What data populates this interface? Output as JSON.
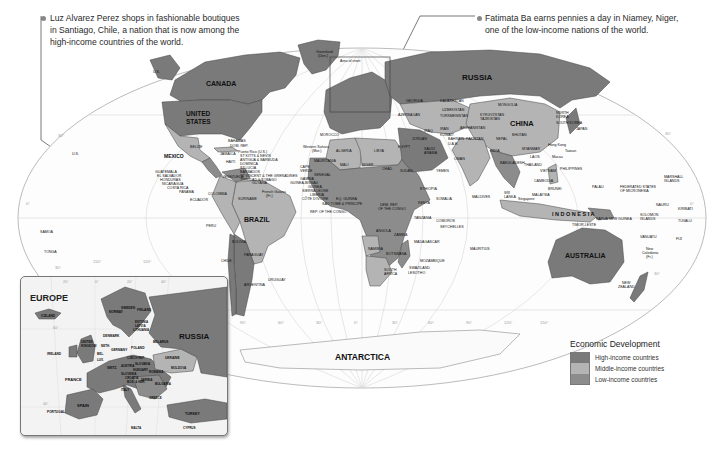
{
  "captions": {
    "left": {
      "text": "Luz Alvarez Perez shops in fashionable boutiques in Santiago, Chile, a nation that is now among the high-income countries of the world.",
      "line1": "Luz Alvarez Perez shops in fashionable boutiques",
      "line2": "in Santiago, Chile, a nation that is now among the",
      "line3": "high-income countries of the world."
    },
    "right": {
      "text": "Fatimata Ba earns pennies a day in Niamey, Niger, one of the low-income nations of the world.",
      "line1": "Fatimata Ba earns pennies a day in Niamey, Niger,",
      "line2": "one of the low-income nations of the world."
    }
  },
  "legend": {
    "title": "Economic Development",
    "items": [
      {
        "label": "High-income countries",
        "color": "#7a7a7a"
      },
      {
        "label": "Middle-income countries",
        "color": "#b4b4b4"
      },
      {
        "label": "Low-income countries",
        "color": "#8c8c8c"
      }
    ]
  },
  "colors": {
    "high": "#7a7a7a",
    "middle": "#b4b4b4",
    "low": "#8c8c8c",
    "ocean": "#ffffff",
    "ocean_tint": "#f2f2f2",
    "border": "#444444",
    "graticule": "#cfcfcf"
  },
  "map": {
    "labels_major": {
      "canada": "CANADA",
      "united_states_1": "UNITED",
      "united_states_2": "STATES",
      "mexico": "MEXICO",
      "brazil": "BRAZIL",
      "russia": "RUSSIA",
      "china": "CHINA",
      "australia": "AUSTRALIA",
      "antarctica": "ANTARCTICA",
      "indonesia": "I N D O N E S I A"
    },
    "labels_minor": {
      "greenland_1": "Greenland",
      "greenland_2": "(Den.)",
      "area_of_inset": "Area of inset",
      "us_alaska": "U.S.",
      "us_hawaii": "U.S.",
      "bahamas": "BAHAMAS",
      "dom_rep": "DOM. REP.",
      "puerto_rico": "Puerto Rico (U.S.)",
      "st_kitts": "ST KITTS & NEVIS",
      "antigua": "ANTIGUA & BARBUDA",
      "dominica": "DOMINICA",
      "st_lucia": "ST LUCIA",
      "barbados": "BARBADOS",
      "st_vincent": "ST VINCENT & THE GRENADINES",
      "trinidad": "TRINIDAD & TOBAGO",
      "belize": "BELIZE",
      "cuba": "CUBA",
      "jamaica": "JAMAICA",
      "haiti": "HAITI",
      "guatemala": "GUATEMALA",
      "el_salvador": "EL SALVADOR",
      "honduras": "HONDURAS",
      "nicaragua": "NICARAGUA",
      "costa_rica": "COSTA RICA",
      "panama": "PANAMA",
      "venezuela": "VENEZUELA",
      "guyana": "GUYANA",
      "suriname": "SURINAME",
      "french_guiana_1": "French Guiana",
      "french_guiana_2": "(Fr.)",
      "colombia": "COLOMBIA",
      "ecuador": "ECUADOR",
      "peru": "PERU",
      "bolivia": "BOLIVIA",
      "paraguay": "PARAGUAY",
      "chile": "CHILE",
      "argentina": "ARGENTINA",
      "uruguay": "URUGUAY",
      "samoa": "SAMOA",
      "tonga": "TONGA",
      "morocco": "MOROCCO",
      "western_sahara_1": "Western Sahara",
      "western_sahara_2": "(Mor.)",
      "algeria": "ALGERIA",
      "libya": "LIBYA",
      "egypt": "EGYPT",
      "mauritania": "MAURITANIA",
      "mali": "MALI",
      "niger": "NIGER",
      "chad": "CHAD",
      "sudan": "SUDAN",
      "cape_verde_1": "CAPE",
      "cape_verde_2": "VERDE",
      "senegal": "SENEGAL",
      "gambia": "GAMBIA",
      "guinea_bissau": "GUINEA-BISSAU",
      "guinea": "GUINEA",
      "sierra_leone": "SIERRA LEONE",
      "liberia": "LIBERIA",
      "cote_divoire": "CÔTE D'IVOIRE",
      "eq_guinea": "EQ. GUINEA",
      "sao_tome": "SAO TOME & PRINCIPE",
      "rep_congo": "REP. OF THE CONGO",
      "dem_rep_congo_1": "DEM. REP.",
      "dem_rep_congo_2": "OF THE CONGO",
      "ethiopia": "ETHIOPIA",
      "somalia": "SOMALIA",
      "kenya": "KENYA",
      "tanzania": "TANZANIA",
      "angola": "ANGOLA",
      "zambia": "ZAMBIA",
      "namibia": "NAMIBIA",
      "botswana": "BOTSWANA",
      "south_africa_1": "SOUTH",
      "south_africa_2": "AFRICA",
      "swaziland": "SWAZILAND",
      "lesotho": "LESOTHO",
      "mozambique": "MOZAMBIQUE",
      "madagascar": "MADAGASCAR",
      "comoros": "COMOROS",
      "seychelles": "SEYCHELLES",
      "mauritius": "MAURITIUS",
      "yemen": "YEMEN",
      "oman": "OMAN",
      "saudi_arabia_1": "SAUDI",
      "saudi_arabia_2": "ARABIA",
      "iraq": "IRAQ",
      "iran": "IRAN",
      "kuwait": "KUWAIT",
      "jordan": "JORDAN",
      "bahrain": "BAHRAIN",
      "qatar": "QATAR",
      "uae": "U.A.E.",
      "georgia": "GEORGIA",
      "azerbaijan": "AZERBAIJAN",
      "kazakhstan": "KAZAKHSTAN",
      "uzbekistan": "UZBEKISTAN",
      "turkmenistan": "TURKMENISTAN",
      "kyrgyzstan": "KYRGYZSTAN",
      "tajikistan": "TAJIKISTAN",
      "afghanistan": "AFGHANISTAN",
      "pakistan": "PAKISTAN",
      "mongolia": "MONGOLIA",
      "india": "INDIA",
      "nepal": "NEPAL",
      "bhutan": "BHUTAN",
      "bangladesh": "BANGLADESH",
      "sri_lanka_1": "SRI",
      "sri_lanka_2": "LANKA",
      "maldives": "MALDIVES",
      "myanmar": "MYANMAR",
      "thailand": "THAILAND",
      "laos": "LAOS",
      "vietnam": "VIETNAM",
      "cambodia": "CAMBODIA",
      "malaysia": "MALAYSIA",
      "singapore": "Singapore",
      "brunei": "BRUNEI",
      "philippines": "PHILIPPINES",
      "taiwan": "Taiwan",
      "macau": "Macau",
      "hong_kong": "Hong Kong",
      "north_korea_1": "NORTH",
      "north_korea_2": "KOREA",
      "south_korea": "SOUTH KOREA",
      "japan": "JAPAN",
      "palau": "PALAU",
      "fsm_1": "FEDERATED STATES",
      "fsm_2": "OF MICRONESIA",
      "marshall_1": "MARSHALL",
      "marshall_2": "ISLANDS",
      "nauru": "NAURU",
      "kiribati": "KIRIBATI",
      "tuvalu": "TUVALU",
      "png": "PAPUA NEW GUINEA",
      "solomon_1": "SOLOMON",
      "solomon_2": "ISLANDS",
      "timor_leste": "TIMOR-LESTE",
      "vanuatu": "VANUATU",
      "fiji": "FIJI",
      "new_caledonia_1": "New",
      "new_caledonia_2": "Caledonia",
      "new_caledonia_3": "(Fr.)",
      "new_zealand_1": "NEW",
      "new_zealand_2": "ZEALAND"
    },
    "graticule_labels": {
      "lat_30n_left": "30°",
      "lat_0_left": "0°",
      "lat_30s_left": "30°",
      "lat_30n_right": "30°",
      "lat_0_right": "0°",
      "lat_30s_right": "30°",
      "lon_150w": "150°",
      "lon_120w": "120°",
      "lon_90w": "90°",
      "lon_60w": "60°",
      "lon_30w": "30°",
      "lon_0": "0°",
      "lon_30e": "30°",
      "lon_60e": "60°",
      "lon_90e": "90°",
      "lon_120e": "120°",
      "lon_150e": "150°"
    }
  },
  "inset": {
    "title": "EUROPE",
    "labels": {
      "iceland": "ICELAND",
      "norway": "NORWAY",
      "sweden": "SWEDEN",
      "finland": "FINLAND",
      "estonia": "ESTONIA",
      "latvia": "LATVIA",
      "lithuania": "LITHUANIA",
      "denmark": "DENMARK",
      "ireland": "IRELAND",
      "uk_1": "UNITED",
      "uk_2": "KINGDOM",
      "neth": "NETH.",
      "bel": "BEL.",
      "lux": "LUX.",
      "germany": "GERMANY",
      "poland": "POLAND",
      "belarus": "BELARUS",
      "russia": "RUSSIA",
      "ukraine": "UKRAINE",
      "moldova": "MOLDOVA",
      "czech": "CZECH REP.",
      "slovakia": "SLOVAKIA",
      "austria": "AUSTRIA",
      "hungary": "HUNGARY",
      "romania": "ROMANIA",
      "switzerland": "SWITZ.",
      "france": "FRANCE",
      "italy": "ITALY",
      "slovenia": "SLOVENIA",
      "croatia": "CROATIA",
      "bosnia": "BOS. & HER.",
      "serbia": "SERBIA",
      "bulgaria": "BULGARIA",
      "greece": "GREECE",
      "spain": "SPAIN",
      "portugal": "PORTUGAL",
      "turkey": "TURKEY",
      "malta": "MALTA",
      "cyprus": "CYPRUS"
    },
    "graticule": {
      "lon_20w": "20°",
      "lon_0": "0°",
      "lon_20e": "20°",
      "lon_40e": "40°",
      "lat_60n": "60°",
      "lat_40n": "40°"
    }
  }
}
